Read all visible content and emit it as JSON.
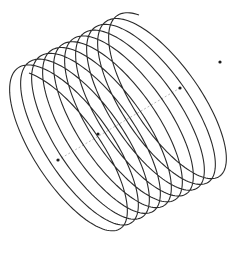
{
  "figure": {
    "type": "3d-helix-wireframe",
    "background": "#ffffff",
    "helix": {
      "turns": 10,
      "color": "#2a2a2a",
      "stroke_width": 1.1,
      "start_center": [
        62,
        152
      ],
      "end_center": [
        172,
        94
      ],
      "ring_axis_a": [
        33,
        79
      ],
      "ring_axis_b": [
        -52,
        -20
      ],
      "end_angle_offset": 0.55
    },
    "axis": {
      "style": "dashed",
      "color": "#b8b8b8",
      "from": [
        58,
        160
      ],
      "to": [
        180,
        88
      ]
    },
    "points": [
      {
        "name": "axis-start-point",
        "x": 58,
        "y": 160
      },
      {
        "name": "axis-mid-point",
        "x": 98,
        "y": 134
      },
      {
        "name": "axis-end-point",
        "x": 180,
        "y": 88
      },
      {
        "name": "helix-end-point",
        "x": 220,
        "y": 62
      }
    ],
    "point_color": "#1a1a1a",
    "point_radius": 1.6
  }
}
